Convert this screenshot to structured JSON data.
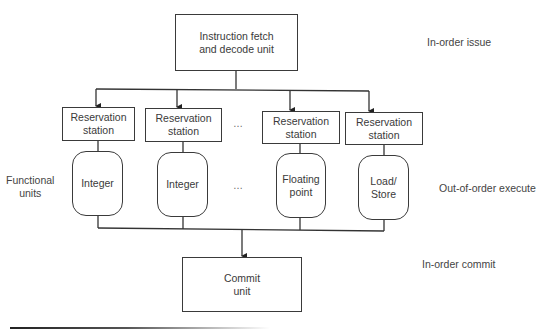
{
  "diagram": {
    "fetch_unit": {
      "label": "Instruction fetch\nand decode unit"
    },
    "reservation_stations": [
      {
        "label": "Reservation\nstation"
      },
      {
        "label": "Reservation\nstation"
      },
      {
        "label": "Reservation\nstation"
      },
      {
        "label": "Reservation\nstation"
      }
    ],
    "functional_units": [
      {
        "label": "Integer"
      },
      {
        "label": "Integer"
      },
      {
        "label": "Floating\npoint"
      },
      {
        "label": "Load/\nStore"
      }
    ],
    "commit_unit": {
      "label": "Commit\nunit"
    },
    "ellipsis": "…",
    "left_label": "Functional\nunits",
    "stage_labels": {
      "issue": "In-order issue",
      "execute": "Out-of-order execute",
      "commit": "In-order commit"
    }
  }
}
